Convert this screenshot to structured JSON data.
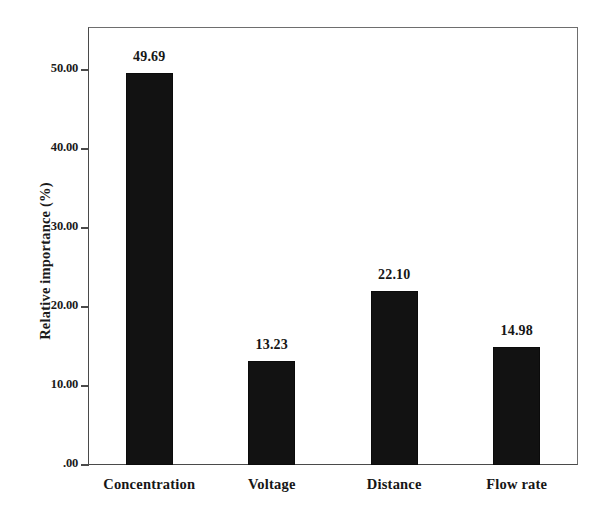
{
  "chart_data": {
    "type": "bar",
    "title": "",
    "xlabel": "",
    "ylabel": "Relative importance (%)",
    "categories": [
      "Concentration",
      "Voltage",
      "Distance",
      "Flow rate"
    ],
    "values": [
      49.69,
      13.23,
      22.1,
      14.98
    ],
    "value_labels": [
      "49.69",
      "13.23",
      "22.10",
      "14.98"
    ],
    "ylim": [
      0,
      55.5
    ],
    "ytick_values": [
      0,
      10,
      20,
      30,
      40,
      50
    ],
    "ytick_labels": [
      ".00",
      "10.00",
      "20.00",
      "30.00",
      "40.00",
      "50.00"
    ],
    "grid": false,
    "legend": false,
    "bar_color": "#121212",
    "axis_color": "#4a4a4a",
    "text_color": "#161616",
    "background": "#ffffff"
  }
}
